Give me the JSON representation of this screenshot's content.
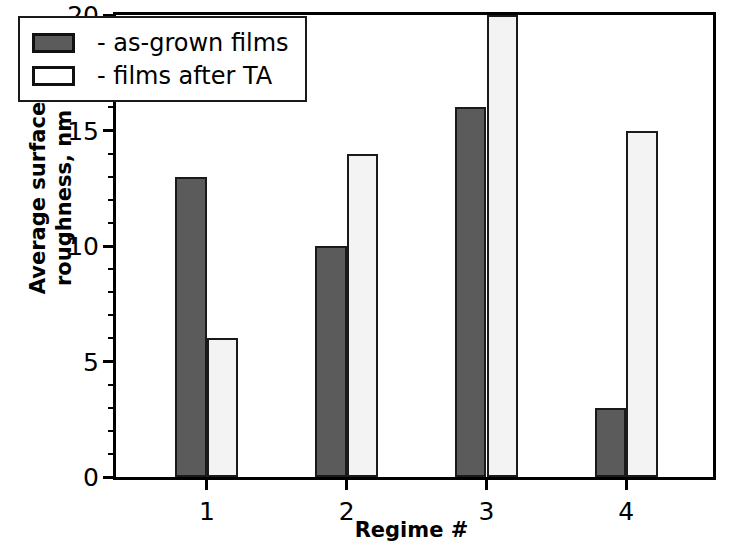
{
  "chart_data": {
    "type": "bar",
    "title": "",
    "xlabel": "Regime #",
    "ylabel": "Average surface roughness, nm",
    "ylabel_lines": [
      "Average surface",
      "roughness, nm"
    ],
    "categories": [
      "1",
      "2",
      "3",
      "4"
    ],
    "series": [
      {
        "name": "- as-grown films",
        "values": [
          13,
          10,
          16,
          3
        ],
        "color": "#5b5b5b"
      },
      {
        "name": "- films after TA",
        "values": [
          6,
          14,
          20,
          15
        ],
        "color": "#f3f3f3"
      }
    ],
    "ylim": [
      0,
      20
    ],
    "ytick_labels": [
      "0",
      "5",
      "10",
      "15",
      "20"
    ],
    "ytick_values": [
      0,
      5,
      10,
      15,
      20
    ],
    "yminor_values": [
      1,
      2,
      3,
      4,
      6,
      7,
      8,
      9,
      11,
      12,
      13,
      14,
      16,
      17,
      18,
      19
    ],
    "xtick_labels": [
      "1",
      "2",
      "3",
      "4"
    ],
    "xtick_values": [
      1,
      2,
      3,
      4
    ],
    "xlim": [
      0.35,
      4.62
    ],
    "grid": false,
    "legend_position": "top-left",
    "frame": true,
    "axis_color": "#000000"
  },
  "legend": {
    "entries": [
      {
        "label": "- as-grown films",
        "swatch": "dark"
      },
      {
        "label": "- films after TA",
        "swatch": "light"
      }
    ]
  }
}
